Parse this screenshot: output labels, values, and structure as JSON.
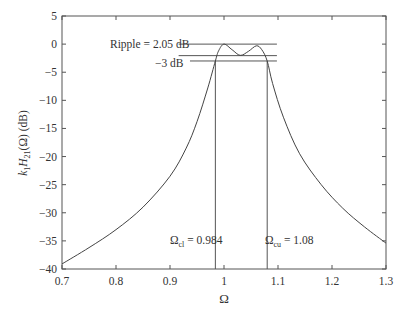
{
  "chart_data": {
    "type": "line",
    "title": "",
    "xlabel": "Ω",
    "ylabel": "k1H21(Ω) (dB)",
    "xlim": [
      0.7,
      1.3
    ],
    "ylim": [
      -40,
      5
    ],
    "grid": false,
    "legend": null,
    "x_ticks": [
      0.7,
      0.8,
      0.9,
      1,
      1.1,
      1.2,
      1.3
    ],
    "x_tick_labels": [
      "0.7",
      "0.8",
      "0.9",
      "1",
      "1.1",
      "1.2",
      "1.3"
    ],
    "y_ticks": [
      5,
      0,
      -5,
      -10,
      -15,
      -20,
      -25,
      -30,
      -35,
      -40
    ],
    "y_tick_labels": [
      "5",
      "0",
      "−5",
      "−10",
      "−15",
      "−20",
      "−25",
      "−30",
      "−35",
      "−40"
    ],
    "series": [
      {
        "name": "k1H21(Ω)",
        "x": [
          0.7,
          0.75,
          0.8,
          0.85,
          0.9,
          0.93,
          0.95,
          0.97,
          0.984,
          0.99,
          1.0,
          1.015,
          1.03,
          1.045,
          1.06,
          1.07,
          1.08,
          1.09,
          1.11,
          1.14,
          1.18,
          1.22,
          1.26,
          1.3
        ],
        "y": [
          -39.1,
          -36.2,
          -33.0,
          -29.0,
          -23.5,
          -18.5,
          -13.8,
          -7.8,
          -3.0,
          -1.2,
          0.0,
          -1.0,
          -2.0,
          -1.3,
          -0.3,
          -1.0,
          -3.0,
          -7.0,
          -13.0,
          -19.5,
          -25.0,
          -29.2,
          -32.5,
          -35.4
        ]
      }
    ],
    "annotations": [
      {
        "text": "Ripple = 2.05 dB",
        "type": "hline",
        "y": 0,
        "x_range": [
          0.916,
          1.098
        ]
      },
      {
        "text": "",
        "type": "hline",
        "y": -2.05,
        "x_range": [
          0.916,
          1.098
        ]
      },
      {
        "text": "−3 dB",
        "type": "hline",
        "y": -3,
        "x_range": [
          0.937,
          1.098
        ]
      },
      {
        "text": "Ωcl = 0.984",
        "type": "vline",
        "x": 0.984
      },
      {
        "text": "Ωcu = 1.08",
        "type": "vline",
        "x": 1.08
      }
    ]
  },
  "labels": {
    "xlabel": "Ω",
    "ylabel_main": "k",
    "ylabel_sub1": "1",
    "ylabel_H": "H",
    "ylabel_sub2": "21",
    "ylabel_rest": "(Ω)  (dB)",
    "ripple": "Ripple = 2.05 dB",
    "minus3db": "−3 dB",
    "omega_cl_sym": "Ω",
    "omega_cl_sub": "cl",
    "omega_cl_val": " = 0.984",
    "omega_cu_sym": "Ω",
    "omega_cu_sub": "cu",
    "omega_cu_val": " = 1.08"
  }
}
